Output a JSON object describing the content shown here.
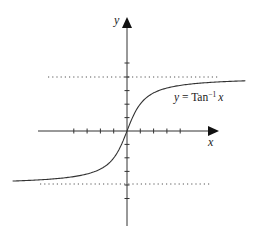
{
  "chart_data": {
    "type": "line",
    "title": "",
    "xlabel": "x",
    "ylabel": "y",
    "series": [
      {
        "name": "y = Tan^-1 x",
        "function": "arctan",
        "x": [
          -8.6,
          -6,
          -4,
          -3,
          -2,
          -1,
          -0.5,
          0,
          0.5,
          1,
          2,
          3,
          4,
          6,
          8.9
        ],
        "values": [
          -1.455,
          -1.406,
          -1.326,
          -1.249,
          -1.107,
          -0.785,
          -0.464,
          0,
          0.464,
          0.785,
          1.107,
          1.249,
          1.326,
          1.406,
          1.459
        ]
      }
    ],
    "asymptotes": [
      {
        "y": 1.5708,
        "label": "π/2",
        "style": "dotted"
      },
      {
        "y": -1.5708,
        "label": "-π/2",
        "style": "dotted"
      }
    ],
    "x_ticks": [
      -4,
      -3,
      -2,
      -1,
      1,
      2,
      3,
      4
    ],
    "y_ticks_count_each_side": 5,
    "xlim": [
      -8.6,
      6.9
    ],
    "ylim": [
      -2.73,
      3.34
    ],
    "grid": false,
    "legend": null,
    "annotations": [
      {
        "text_main": "y = Tan",
        "superscript": "−1",
        "text_tail": " x",
        "position": "right of curve, below upper asymptote"
      }
    ]
  },
  "labels": {
    "x_axis": "x",
    "y_axis": "y",
    "curve_label_prefix": "y",
    "curve_label_eq": " = Tan",
    "curve_label_sup": "−1",
    "curve_label_var": "x"
  },
  "colors": {
    "axis": "#333333",
    "curve": "#333333",
    "asymptote": "#555555",
    "background": "#ffffff"
  }
}
